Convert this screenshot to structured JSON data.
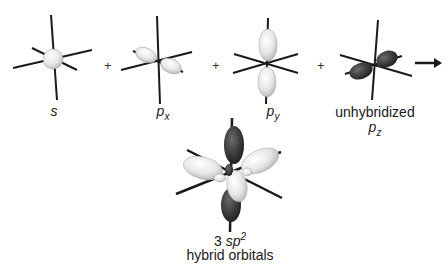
{
  "diagram": {
    "components": [
      {
        "id": "s",
        "label": "s",
        "type": "s-orbital"
      },
      {
        "id": "px",
        "label": "p",
        "subscript": "x",
        "type": "p-orbital"
      },
      {
        "id": "py",
        "label": "p",
        "subscript": "y",
        "type": "p-orbital"
      },
      {
        "id": "pz",
        "label_top": "unhybridized",
        "label": "p",
        "subscript": "z",
        "type": "p-orbital-dark"
      }
    ],
    "operators": [
      "+",
      "+",
      "+"
    ],
    "arrow": "→",
    "result": {
      "count": "3",
      "label": "sp",
      "superscript": "2",
      "caption": "hybrid orbitals"
    },
    "colors": {
      "light_lobe": "#e8e8e8",
      "dark_lobe": "#3a3a3a",
      "axis": "#1a1a1a"
    }
  }
}
